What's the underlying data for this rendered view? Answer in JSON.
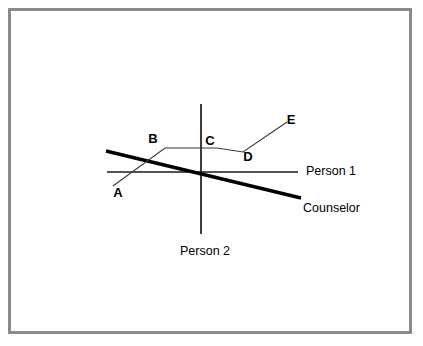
{
  "figure": {
    "title": "",
    "canvas": {
      "width": 423,
      "height": 346,
      "background": "#ffffff"
    },
    "frame": {
      "name": "outer-border",
      "x": 8,
      "y": 8,
      "width": 404,
      "height": 326,
      "stroke": "#8a8a8a",
      "stroke_width": 3
    },
    "axes": {
      "vertical": {
        "label": "Person 2",
        "x": 201,
        "y1": 104,
        "y2": 234,
        "stroke": "#1a1a1a",
        "stroke_width": 1.6,
        "label_x": 205,
        "label_y": 252
      },
      "horizontal": {
        "label": "Person 1",
        "y": 172,
        "x1": 107,
        "x2": 298,
        "stroke": "#1a1a1a",
        "stroke_width": 1.6,
        "label_x": 306,
        "label_y": 172
      }
    },
    "counselor_line": {
      "label": "Counselor",
      "x1": 106,
      "y1": 151,
      "x2": 301,
      "y2": 198,
      "stroke": "#000000",
      "stroke_width": 3.4,
      "label_x": 303,
      "label_y": 209
    },
    "polyline": {
      "name": "path-A-B-C-D-E",
      "stroke": "#3a3a3a",
      "stroke_width": 1.1,
      "points": "113,186 165,148 217,148 243,152 287,122",
      "vertices": [
        {
          "id": "A",
          "x": 113,
          "y": 186,
          "label_x": 118,
          "label_y": 197
        },
        {
          "id": "B",
          "x": 165,
          "y": 148,
          "label_x": 153,
          "label_y": 143
        },
        {
          "id": "C",
          "x": 217,
          "y": 148,
          "label_x": 210,
          "label_y": 145
        },
        {
          "id": "D",
          "x": 243,
          "y": 152,
          "label_x": 248,
          "label_y": 161
        },
        {
          "id": "E",
          "x": 287,
          "y": 122,
          "label_x": 291,
          "label_y": 124
        }
      ]
    },
    "labels": {
      "person_1": "Person 1",
      "person_2": "Person 2",
      "counselor": "Counselor",
      "a": "A",
      "b": "B",
      "c": "C",
      "d": "D",
      "e": "E"
    },
    "colors": {
      "ink": "#000000",
      "frame": "#8a8a8a",
      "thin_line": "#3a3a3a",
      "background": "#ffffff"
    }
  }
}
